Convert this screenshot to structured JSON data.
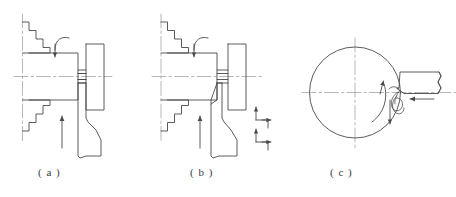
{
  "figure": {
    "stroke_color": "#4a4a4a",
    "centerline_color": "#8a8a8a",
    "background": "#ffffff",
    "captions": [
      {
        "id": "a",
        "label": "( a )"
      },
      {
        "id": "b",
        "label": "( b )"
      },
      {
        "id": "c",
        "label": "( c )"
      }
    ],
    "panels": [
      {
        "id": "a",
        "name": "side-view-straight-parting",
        "caption": "( a )",
        "parts": [
          "stepped-chuck-jaws",
          "workpiece-body",
          "parting-groove",
          "parted-disc",
          "parting-tool",
          "radial-feed-arrow",
          "rotation-arrow",
          "horizontal-centerline",
          "vertical-centerline"
        ]
      },
      {
        "id": "b",
        "name": "side-view-stepped-parting",
        "caption": "( b )",
        "parts": [
          "stepped-chuck-jaws",
          "workpiece-body",
          "chamfered-face",
          "parting-groove",
          "parted-disc",
          "parting-tool",
          "radial-feed-arrow",
          "rotation-arrow",
          "stepped-feed-path-upper",
          "stepped-feed-path-lower",
          "horizontal-centerline",
          "vertical-centerline"
        ]
      },
      {
        "id": "c",
        "name": "end-view-chip-formation",
        "caption": "( c )",
        "parts": [
          "workpiece-circle",
          "rotation-arrow",
          "cutting-tool-shank",
          "tool-break-line",
          "chip-spiral",
          "feed-arrow-horizontal",
          "feed-arrow-vertical",
          "horizontal-centerline",
          "vertical-centerline"
        ]
      }
    ]
  }
}
